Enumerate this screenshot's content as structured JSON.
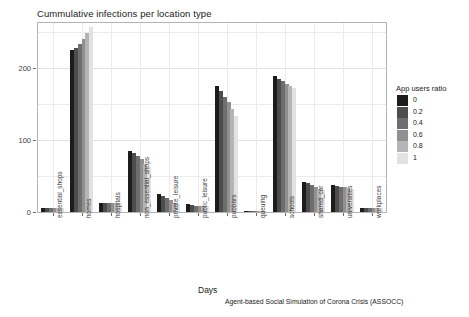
{
  "chart_data": {
    "type": "bar",
    "title": "Cummulative infections per location type",
    "xlabel": "Days",
    "ylabel": "Number of infections",
    "caption": "Agent-based Social Simulation of Corona Crisis (ASSOCC)",
    "grid": true,
    "legend_position": "right",
    "legend_title": "App users ratio",
    "ylim": [
      0,
      262
    ],
    "yticks": [
      0,
      100,
      200
    ],
    "ytick_labels": [
      "0",
      "100",
      "200"
    ],
    "categories": [
      "essential_shops",
      "homes",
      "hospitals",
      "non_essential_shops",
      "private_leisure",
      "public_leisure",
      "pubbars",
      "queuing",
      "schools",
      "shared_car",
      "universities",
      "workplaces"
    ],
    "series": [
      {
        "name": "0",
        "color": "#1c1c1c",
        "values": [
          6,
          224,
          13,
          85,
          25,
          11,
          175,
          1,
          188,
          42,
          37,
          5
        ]
      },
      {
        "name": "0.2",
        "color": "#4d4d4d",
        "values": [
          6,
          228,
          13,
          82,
          22,
          10,
          168,
          1,
          185,
          40,
          36,
          5
        ]
      },
      {
        "name": "0.4",
        "color": "#6e6e6e",
        "values": [
          6,
          233,
          13,
          78,
          19,
          9,
          160,
          1,
          181,
          37,
          35,
          5
        ]
      },
      {
        "name": "0.6",
        "color": "#909090",
        "values": [
          6,
          240,
          13,
          73,
          16,
          9,
          152,
          1,
          178,
          35,
          34,
          5
        ]
      },
      {
        "name": "0.8",
        "color": "#b5b5b5",
        "values": [
          6,
          248,
          13,
          67,
          13,
          8,
          143,
          1,
          175,
          32,
          33,
          5
        ]
      },
      {
        "name": "1",
        "color": "#e2e2e2",
        "values": [
          6,
          256,
          13,
          62,
          11,
          8,
          133,
          1,
          172,
          30,
          32,
          5
        ]
      }
    ]
  },
  "legend": {
    "title": "App users ratio",
    "items": [
      {
        "label": "0",
        "color": "#1c1c1c"
      },
      {
        "label": "0.2",
        "color": "#4d4d4d"
      },
      {
        "label": "0.4",
        "color": "#6e6e6e"
      },
      {
        "label": "0.6",
        "color": "#909090"
      },
      {
        "label": "0.8",
        "color": "#b5b5b5"
      },
      {
        "label": "1",
        "color": "#e2e2e2"
      }
    ]
  }
}
